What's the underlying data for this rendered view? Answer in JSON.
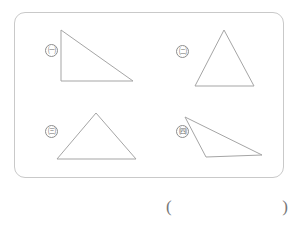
{
  "worksheet": {
    "figure_panel": {
      "name": "figure-panel",
      "border_color": "#c9c9c9",
      "stroke_color": "#a5a5a5",
      "figures": [
        {
          "label": "ㄱ",
          "label_marker": "㈠",
          "shape": "right-triangle",
          "points": "61,30 61,81 133,81"
        },
        {
          "label": "ㄴ",
          "label_marker": "㈡",
          "shape": "isosceles-triangle",
          "points": "224,30 195,86 254,86"
        },
        {
          "label": "ㄷ",
          "label_marker": "㈢",
          "shape": "isosceles-triangle-wide",
          "points": "96,113 57,159 136,159"
        },
        {
          "label": "ㄹ",
          "label_marker": "㈣",
          "shape": "obtuse-scalene-triangle",
          "points": "185,117 206,157 262,155"
        }
      ]
    },
    "answer_blank": {
      "open_paren": "(",
      "close_paren": ")",
      "value": ""
    }
  }
}
